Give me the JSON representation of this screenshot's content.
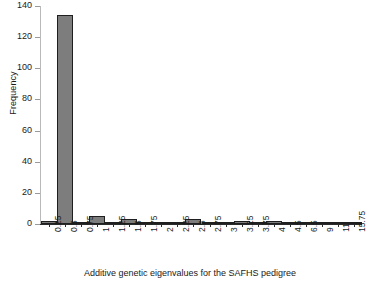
{
  "chart_data": {
    "type": "bar",
    "title": "",
    "xlabel": "Additive genetic eigenvalues for the SAFHS pedigree",
    "ylabel": "Frequency",
    "categories": [
      "0.25",
      "0.5",
      "0.75",
      "1",
      "1.25",
      "1.5",
      "1.75",
      "2",
      "2.25",
      "2.5",
      "2.75",
      "3",
      "3.25",
      "3.75",
      "4",
      "4.5",
      "6.5",
      "9",
      "11",
      "15.75"
    ],
    "values": [
      2,
      134,
      1,
      5,
      1,
      3,
      1,
      1,
      1,
      3,
      1,
      1,
      2,
      1,
      2,
      1,
      1,
      1,
      1,
      1
    ],
    "ylim": [
      0,
      140
    ],
    "yticks": [
      0,
      20,
      40,
      60,
      80,
      100,
      120,
      140
    ],
    "ytick_labels": [
      "0",
      "20",
      "40",
      "60",
      "80",
      "100",
      "120",
      "140"
    ],
    "grid": false,
    "legend": "none",
    "bar_color": "#7d7d7d",
    "bar_edge_color": "#1f1f1f",
    "axis_color": "#2b2b2b",
    "text_color": "#1a1a1a"
  }
}
